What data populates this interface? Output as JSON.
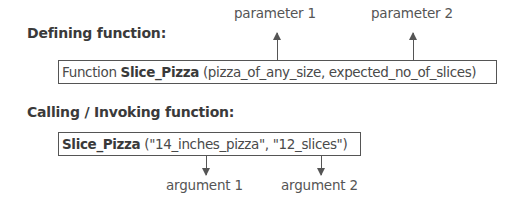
{
  "defining": {
    "heading": "Defining function:",
    "keyword": "Function",
    "function_name": "Slice_Pizza",
    "params_text": "(pizza_of_any_size, expected_no_of_slices)",
    "labels": [
      "parameter 1",
      "parameter 2"
    ]
  },
  "calling": {
    "heading": "Calling / Invoking function:",
    "function_name": "Slice_Pizza",
    "args_text": "(\"14_inches_pizza\", \"12_slices\")",
    "labels": [
      "argument 1",
      "argument 2"
    ]
  },
  "colors": {
    "text": "#444444",
    "heading": "#3a3a3a",
    "border": "#555555",
    "background": "#ffffff"
  }
}
